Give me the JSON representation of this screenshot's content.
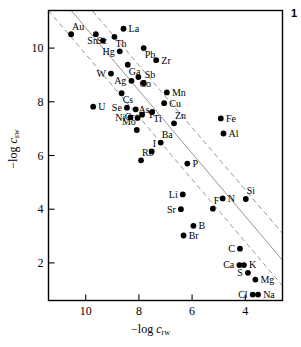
{
  "figure": {
    "number": "1",
    "axis_x_label_prefix": "−log ",
    "axis_x_label_var": "c",
    "axis_x_label_sub": "rw",
    "axis_y_label_prefix": "−log ",
    "axis_y_label_var": "c",
    "axis_y_label_sub": "sw"
  },
  "chart_data": {
    "type": "scatter",
    "title": "",
    "xlabel": "−log c_rw",
    "ylabel": "−log c_sw",
    "xlim": [
      11.4,
      2.6
    ],
    "ylim": [
      11.4,
      0.6
    ],
    "xticks": [
      10,
      8,
      6,
      4
    ],
    "yticks": [
      2,
      4,
      6,
      8,
      10
    ],
    "grid": false,
    "legend": null,
    "axis_note": "both axes are negative logarithms; values increase downward on y and leftward on x",
    "point_color": "#000000",
    "line_color": "#8a8a8a",
    "lines": [
      {
        "name": "upper-dashed-bound",
        "style": "dashed",
        "x1": 11.4,
        "y1": 11.4,
        "x2": 2.6,
        "y2": 1.15
      },
      {
        "name": "central-regression",
        "style": "solid",
        "x1": 11.4,
        "y1": 12.4,
        "x2": 2.6,
        "y2": 2.1
      },
      {
        "name": "lower-dashed-bound",
        "style": "dashed",
        "x1": 11.4,
        "y1": 13.3,
        "x2": 2.6,
        "y2": 3.1
      }
    ],
    "points": [
      {
        "label": "Cl",
        "x": 3.72,
        "y": 0.82,
        "lpos": "left"
      },
      {
        "label": "Na",
        "x": 3.52,
        "y": 0.82,
        "lpos": "right"
      },
      {
        "label": "Mg",
        "x": 3.62,
        "y": 1.38,
        "lpos": "right"
      },
      {
        "label": "S",
        "x": 3.9,
        "y": 1.63,
        "lpos": "left"
      },
      {
        "label": "Ca",
        "x": 4.22,
        "y": 1.92,
        "lpos": "left"
      },
      {
        "label": "K",
        "x": 4.05,
        "y": 1.92,
        "lpos": "right"
      },
      {
        "label": "C",
        "x": 4.2,
        "y": 2.53,
        "lpos": "left"
      },
      {
        "label": "Br",
        "x": 6.32,
        "y": 3.02,
        "lpos": "right"
      },
      {
        "label": "B",
        "x": 5.95,
        "y": 3.38,
        "lpos": "right"
      },
      {
        "label": "F",
        "x": 5.22,
        "y": 4.02,
        "lpos": "above-right"
      },
      {
        "label": "Sr",
        "x": 6.42,
        "y": 4.0,
        "lpos": "left"
      },
      {
        "label": "N",
        "x": 4.85,
        "y": 4.4,
        "lpos": "right"
      },
      {
        "label": "Si",
        "x": 3.98,
        "y": 4.38,
        "lpos": "above-right"
      },
      {
        "label": "Li",
        "x": 6.35,
        "y": 4.55,
        "lpos": "left"
      },
      {
        "label": "Rb",
        "x": 7.92,
        "y": 5.82,
        "lpos": "above-right"
      },
      {
        "label": "P",
        "x": 6.18,
        "y": 5.7,
        "lpos": "right"
      },
      {
        "label": "I",
        "x": 7.52,
        "y": 6.15,
        "lpos": "above-right"
      },
      {
        "label": "Ba",
        "x": 7.18,
        "y": 6.48,
        "lpos": "above-right"
      },
      {
        "label": "Al",
        "x": 4.82,
        "y": 6.82,
        "lpos": "right"
      },
      {
        "label": "Mo",
        "x": 8.08,
        "y": 6.95,
        "lpos": "above-left"
      },
      {
        "label": "Zn",
        "x": 6.68,
        "y": 7.2,
        "lpos": "above-right"
      },
      {
        "label": "Fe",
        "x": 4.92,
        "y": 7.38,
        "lpos": "right"
      },
      {
        "label": "Ni",
        "x": 8.32,
        "y": 7.42,
        "lpos": "left"
      },
      {
        "label": "As",
        "x": 8.05,
        "y": 7.4,
        "lpos": "above-right"
      },
      {
        "label": "Y",
        "x": 7.88,
        "y": 7.52,
        "lpos": "right"
      },
      {
        "label": "Ti",
        "x": 7.5,
        "y": 7.62,
        "lpos": "below-right"
      },
      {
        "label": "Cr",
        "x": 8.12,
        "y": 7.72,
        "lpos": "below-left"
      },
      {
        "label": "Se",
        "x": 8.45,
        "y": 7.78,
        "lpos": "left"
      },
      {
        "label": "U",
        "x": 9.72,
        "y": 7.82,
        "lpos": "right"
      },
      {
        "label": "Cu",
        "x": 7.05,
        "y": 7.95,
        "lpos": "right"
      },
      {
        "label": "Cs",
        "x": 8.65,
        "y": 8.32,
        "lpos": "below-right"
      },
      {
        "label": "Mn",
        "x": 6.95,
        "y": 8.35,
        "lpos": "right"
      },
      {
        "label": "Sb",
        "x": 7.82,
        "y": 8.7,
        "lpos": "above-right"
      },
      {
        "label": "Ag",
        "x": 8.28,
        "y": 8.78,
        "lpos": "left"
      },
      {
        "label": "Co",
        "x": 8.02,
        "y": 8.92,
        "lpos": "below-right"
      },
      {
        "label": "W",
        "x": 9.05,
        "y": 9.05,
        "lpos": "left"
      },
      {
        "label": "Ga",
        "x": 8.42,
        "y": 9.38,
        "lpos": "below-right"
      },
      {
        "label": "Zr",
        "x": 7.35,
        "y": 9.55,
        "lpos": "right"
      },
      {
        "label": "Hg",
        "x": 8.72,
        "y": 9.88,
        "lpos": "left"
      },
      {
        "label": "Pb",
        "x": 7.82,
        "y": 10.0,
        "lpos": "below-right"
      },
      {
        "label": "Sn",
        "x": 9.35,
        "y": 10.28,
        "lpos": "left"
      },
      {
        "label": "Th",
        "x": 8.92,
        "y": 10.42,
        "lpos": "below-right"
      },
      {
        "label": "Au",
        "x": 10.55,
        "y": 10.52,
        "lpos": "above-right"
      },
      {
        "label": "Sc",
        "x": 9.62,
        "y": 10.52,
        "lpos": "below-right"
      },
      {
        "label": "La",
        "x": 8.58,
        "y": 10.72,
        "lpos": "right"
      }
    ]
  }
}
